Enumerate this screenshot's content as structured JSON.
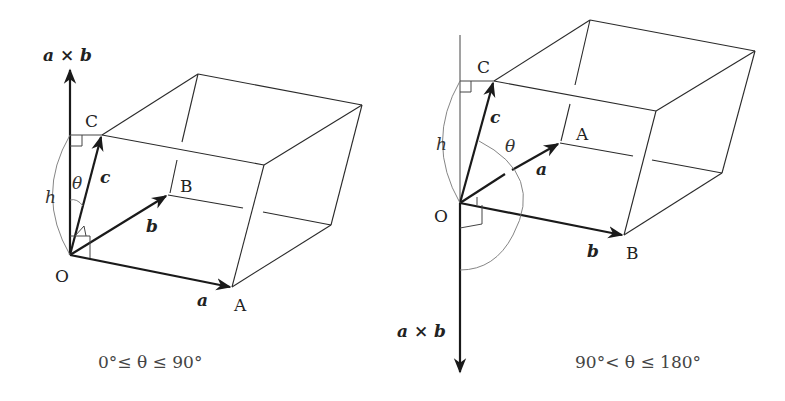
{
  "left_diagram": {
    "caption": "0°≤ θ ≤ 90°",
    "labels": {
      "cross": "a × b",
      "O": "O",
      "A": "A",
      "B": "B",
      "C": "C",
      "vec_a": "a",
      "vec_b": "b",
      "vec_c": "c",
      "theta": "θ",
      "h": "h"
    }
  },
  "right_diagram": {
    "caption": "90°< θ ≤ 180°",
    "labels": {
      "cross": "a × b",
      "O": "O",
      "A": "A",
      "B": "B",
      "C": "C",
      "vec_a": "a",
      "vec_b": "b",
      "vec_c": "c",
      "theta": "θ",
      "h": "h"
    }
  },
  "colors": {
    "line": "#2a2a2a",
    "background": "#ffffff"
  }
}
